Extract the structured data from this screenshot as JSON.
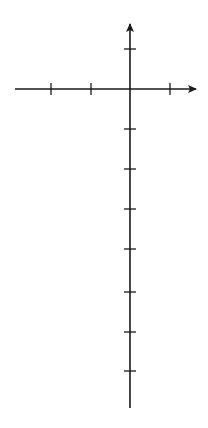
{
  "diagram": {
    "type": "graph-region-between-curves",
    "axes": {
      "x_label": "x",
      "y_label": "y",
      "origin_label": "O",
      "x_tick_label": "2",
      "y_tick_label": "2",
      "unit_px": 20,
      "origin_px": [
        130,
        89
      ]
    },
    "curves": [
      {
        "name": "parabola",
        "equation": "y = -x^2/2",
        "color": "#1a1a1a"
      },
      {
        "name": "line",
        "equation": "y = 2x - 3",
        "color": "#1a1a1a"
      }
    ],
    "shaded_region": {
      "description": "region enclosed between parabola and line",
      "fill": "#d9d9d9"
    },
    "intersections": [
      [
        -5.16,
        -13.3
      ],
      [
        1.16,
        -0.68
      ]
    ]
  }
}
